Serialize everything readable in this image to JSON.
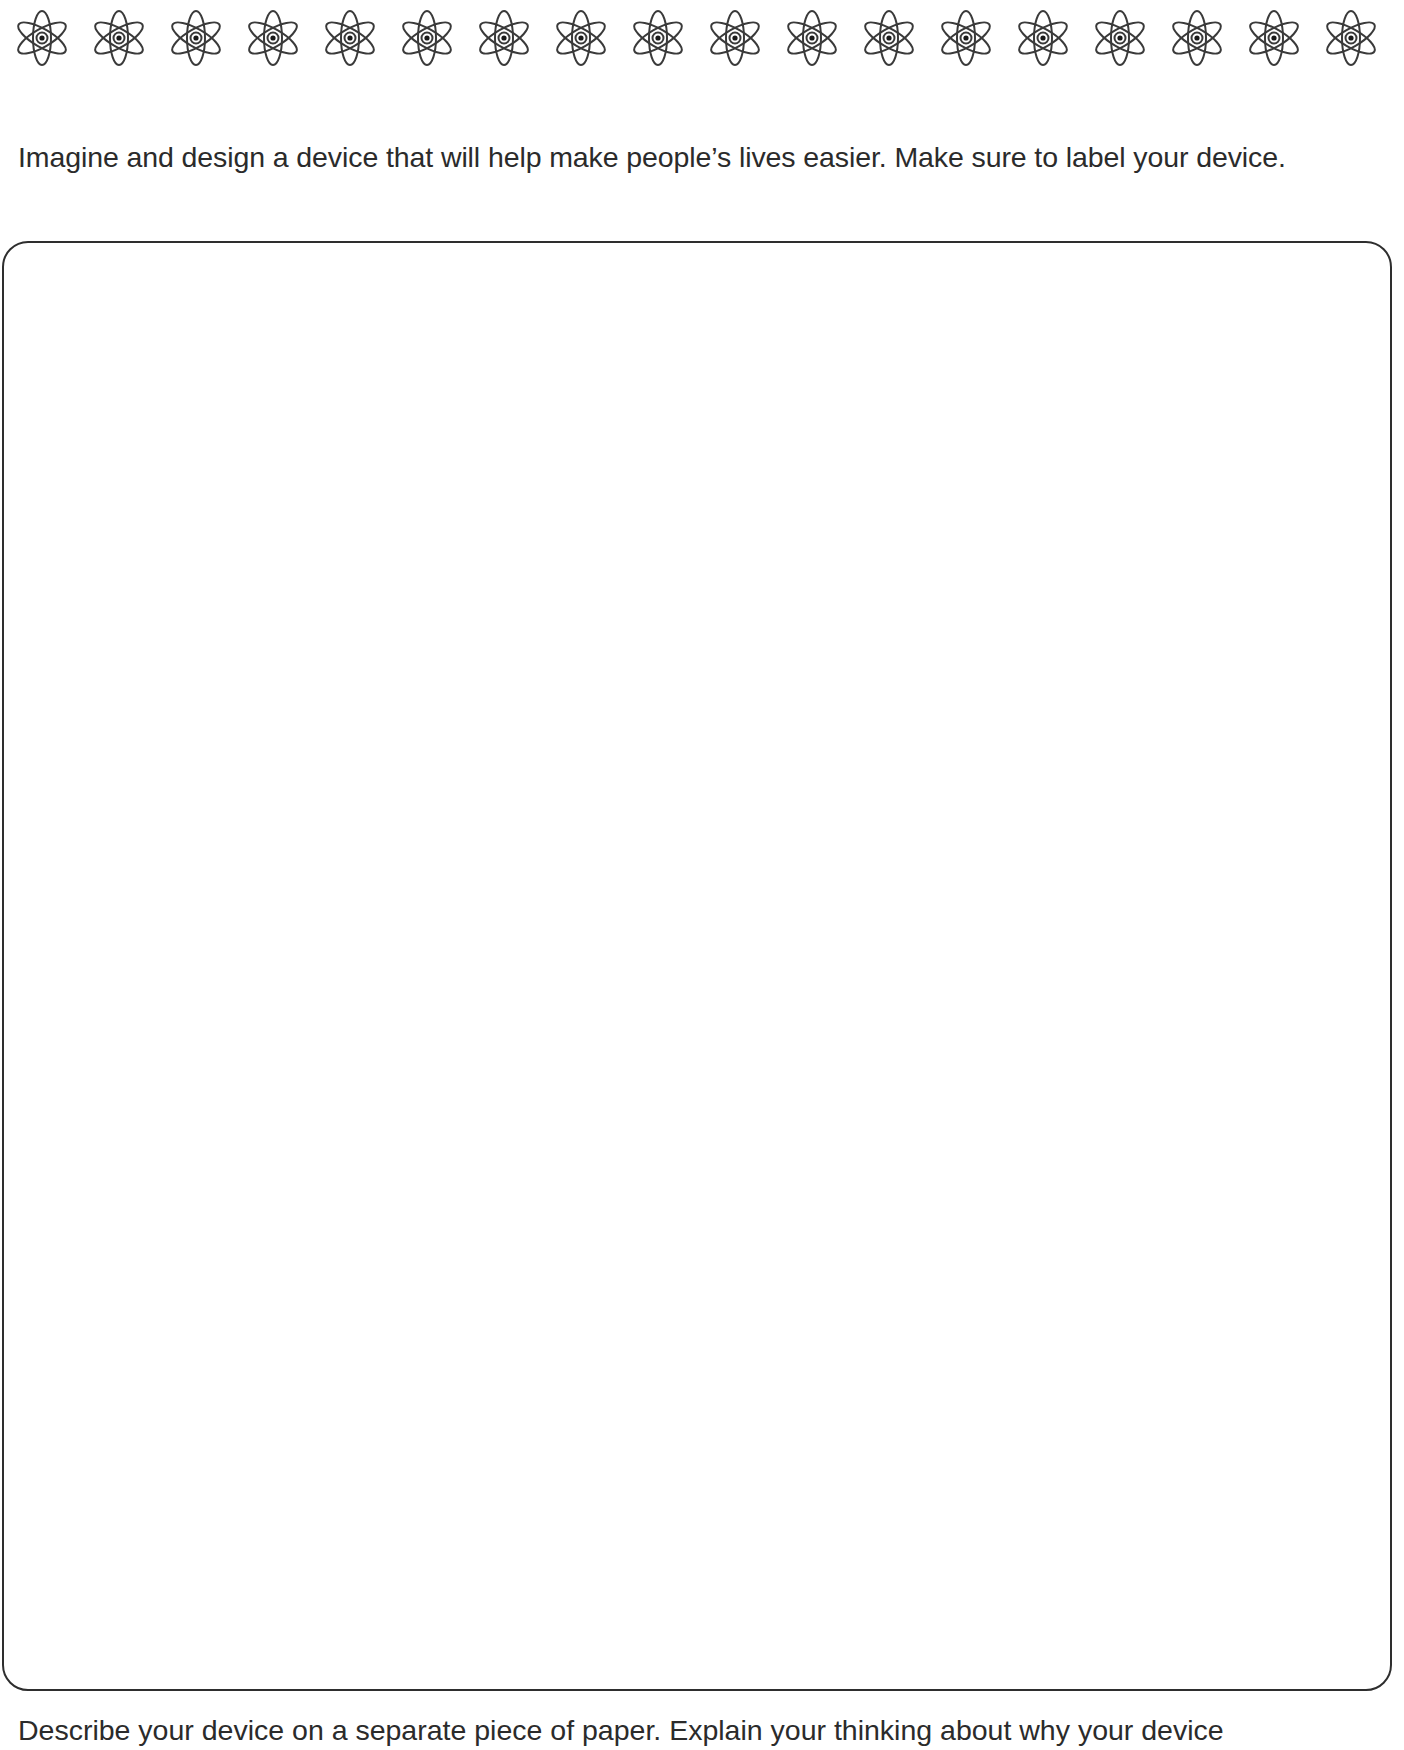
{
  "header": {
    "decoration": {
      "icon": "atom-icon",
      "count": 18,
      "spacing_px": 77,
      "stroke_color": "#3a3a3a"
    }
  },
  "instruction": {
    "text": "Imagine and design a device that will help make people’s lives easier. Make sure to label your device."
  },
  "drawing_area": {
    "label": "",
    "border_color": "#2e2e2e"
  },
  "followup": {
    "text": "Describe your device on a separate piece of paper. Explain your thinking about why your device"
  }
}
